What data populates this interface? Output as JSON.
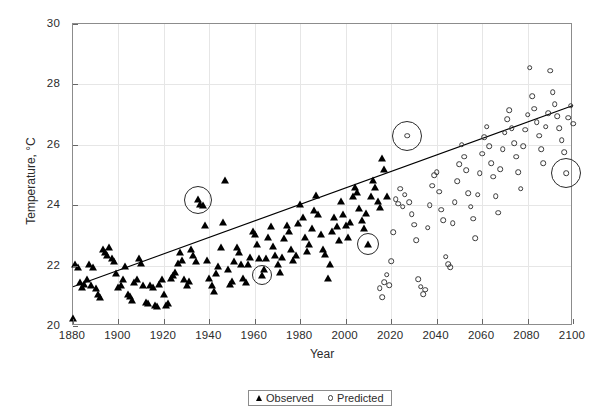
{
  "chart_data": {
    "type": "scatter",
    "title": "",
    "xlabel": "Year",
    "ylabel": "Temperature, °C",
    "xlim": [
      1880,
      2100
    ],
    "ylim": [
      20,
      30
    ],
    "xticks": [
      1880,
      1900,
      1920,
      1940,
      1960,
      1980,
      2000,
      2020,
      2040,
      2060,
      2080,
      2100
    ],
    "yticks": [
      20,
      22,
      24,
      26,
      28,
      30
    ],
    "grid": true,
    "legend_position": "below-plot-center",
    "legend": [
      {
        "label": "Observed",
        "marker": "filled-triangle",
        "color": "#000000"
      },
      {
        "label": "Predicted",
        "marker": "open-circle",
        "color": "#3a3a3a"
      }
    ],
    "trendline": {
      "type": "linear",
      "x": [
        1880,
        2100
      ],
      "y": [
        21.3,
        27.3
      ],
      "color": "#000000"
    },
    "series": [
      {
        "name": "Observed",
        "marker": "filled-triangle",
        "points": [
          [
            1880,
            20.25
          ],
          [
            1881,
            22.05
          ],
          [
            1882,
            21.95
          ],
          [
            1883,
            21.45
          ],
          [
            1884,
            21.3
          ],
          [
            1885,
            21.4
          ],
          [
            1886,
            21.55
          ],
          [
            1887,
            22.05
          ],
          [
            1888,
            21.35
          ],
          [
            1889,
            21.95
          ],
          [
            1890,
            21.25
          ],
          [
            1891,
            21.05
          ],
          [
            1892,
            20.95
          ],
          [
            1893,
            22.55
          ],
          [
            1894,
            22.45
          ],
          [
            1895,
            22.35
          ],
          [
            1896,
            22.6
          ],
          [
            1897,
            22.25
          ],
          [
            1898,
            22.15
          ],
          [
            1899,
            21.75
          ],
          [
            1900,
            21.3
          ],
          [
            1901,
            21.35
          ],
          [
            1902,
            21.55
          ],
          [
            1903,
            22.0
          ],
          [
            1904,
            21.05
          ],
          [
            1905,
            21.0
          ],
          [
            1906,
            20.85
          ],
          [
            1907,
            21.45
          ],
          [
            1908,
            21.55
          ],
          [
            1909,
            22.25
          ],
          [
            1910,
            22.1
          ],
          [
            1911,
            21.35
          ],
          [
            1912,
            20.8
          ],
          [
            1913,
            20.75
          ],
          [
            1914,
            21.35
          ],
          [
            1915,
            21.3
          ],
          [
            1916,
            20.7
          ],
          [
            1917,
            20.65
          ],
          [
            1918,
            21.4
          ],
          [
            1919,
            21.55
          ],
          [
            1920,
            21.05
          ],
          [
            1921,
            20.7
          ],
          [
            1922,
            20.75
          ],
          [
            1923,
            21.6
          ],
          [
            1924,
            21.7
          ],
          [
            1925,
            21.8
          ],
          [
            1926,
            22.1
          ],
          [
            1927,
            22.45
          ],
          [
            1928,
            22.2
          ],
          [
            1929,
            21.55
          ],
          [
            1930,
            21.35
          ],
          [
            1931,
            21.5
          ],
          [
            1932,
            22.55
          ],
          [
            1933,
            22.35
          ],
          [
            1934,
            22.15
          ],
          [
            1935,
            24.2
          ],
          [
            1936,
            24.05
          ],
          [
            1937,
            24.0
          ],
          [
            1938,
            23.35
          ],
          [
            1939,
            22.2
          ],
          [
            1940,
            21.6
          ],
          [
            1941,
            21.35
          ],
          [
            1942,
            21.15
          ],
          [
            1943,
            21.75
          ],
          [
            1944,
            22.0
          ],
          [
            1945,
            22.6
          ],
          [
            1946,
            23.45
          ],
          [
            1947,
            24.85
          ],
          [
            1948,
            21.9
          ],
          [
            1949,
            21.4
          ],
          [
            1950,
            21.5
          ],
          [
            1951,
            22.15
          ],
          [
            1952,
            22.6
          ],
          [
            1953,
            22.45
          ],
          [
            1954,
            22.05
          ],
          [
            1955,
            21.6
          ],
          [
            1956,
            21.45
          ],
          [
            1957,
            22.05
          ],
          [
            1958,
            22.3
          ],
          [
            1959,
            23.15
          ],
          [
            1960,
            23.05
          ],
          [
            1961,
            22.7
          ],
          [
            1962,
            22.25
          ],
          [
            1963,
            21.7
          ],
          [
            1964,
            21.9
          ],
          [
            1965,
            22.25
          ],
          [
            1966,
            22.95
          ],
          [
            1967,
            23.3
          ],
          [
            1968,
            22.65
          ],
          [
            1969,
            22.35
          ],
          [
            1970,
            22.05
          ],
          [
            1971,
            21.8
          ],
          [
            1972,
            22.3
          ],
          [
            1973,
            22.9
          ],
          [
            1974,
            23.35
          ],
          [
            1975,
            23.15
          ],
          [
            1976,
            22.55
          ],
          [
            1977,
            22.2
          ],
          [
            1978,
            22.35
          ],
          [
            1979,
            23.4
          ],
          [
            1980,
            24.05
          ],
          [
            1981,
            23.6
          ],
          [
            1982,
            22.95
          ],
          [
            1983,
            22.5
          ],
          [
            1984,
            22.7
          ],
          [
            1985,
            23.25
          ],
          [
            1986,
            23.85
          ],
          [
            1987,
            24.35
          ],
          [
            1988,
            23.7
          ],
          [
            1989,
            23.05
          ],
          [
            1990,
            22.55
          ],
          [
            1991,
            22.4
          ],
          [
            1992,
            21.6
          ],
          [
            1993,
            22.05
          ],
          [
            1994,
            23.15
          ],
          [
            1995,
            23.6
          ],
          [
            1996,
            23.3
          ],
          [
            1997,
            22.85
          ],
          [
            1998,
            24.15
          ],
          [
            1999,
            23.7
          ],
          [
            2000,
            23.35
          ],
          [
            2001,
            22.95
          ],
          [
            2002,
            23.45
          ],
          [
            2003,
            24.3
          ],
          [
            2004,
            24.6
          ],
          [
            2005,
            24.45
          ],
          [
            2006,
            23.9
          ],
          [
            2007,
            23.5
          ],
          [
            2008,
            23.25
          ],
          [
            2009,
            23.75
          ],
          [
            2010,
            22.7
          ],
          [
            2011,
            24.3
          ],
          [
            2012,
            24.85
          ],
          [
            2013,
            24.6
          ],
          [
            2014,
            24.15
          ],
          [
            2015,
            23.95
          ],
          [
            2016,
            25.55
          ],
          [
            2017,
            25.2
          ],
          [
            2018,
            24.3
          ]
        ]
      },
      {
        "name": "Predicted",
        "marker": "open-circle",
        "points": [
          [
            2015,
            21.25
          ],
          [
            2016,
            20.95
          ],
          [
            2017,
            21.45
          ],
          [
            2018,
            21.7
          ],
          [
            2019,
            21.35
          ],
          [
            2020,
            22.15
          ],
          [
            2021,
            23.1
          ],
          [
            2022,
            24.2
          ],
          [
            2023,
            24.05
          ],
          [
            2024,
            24.55
          ],
          [
            2025,
            23.95
          ],
          [
            2026,
            24.35
          ],
          [
            2027,
            26.3
          ],
          [
            2028,
            24.1
          ],
          [
            2029,
            23.7
          ],
          [
            2030,
            23.35
          ],
          [
            2031,
            22.85
          ],
          [
            2032,
            21.55
          ],
          [
            2033,
            21.3
          ],
          [
            2034,
            21.05
          ],
          [
            2035,
            21.2
          ],
          [
            2036,
            23.25
          ],
          [
            2037,
            24.0
          ],
          [
            2038,
            24.65
          ],
          [
            2039,
            25.0
          ],
          [
            2040,
            25.1
          ],
          [
            2041,
            24.45
          ],
          [
            2042,
            23.85
          ],
          [
            2043,
            23.5
          ],
          [
            2044,
            22.3
          ],
          [
            2045,
            22.05
          ],
          [
            2046,
            21.95
          ],
          [
            2047,
            23.4
          ],
          [
            2048,
            24.1
          ],
          [
            2049,
            24.8
          ],
          [
            2050,
            25.35
          ],
          [
            2051,
            26.0
          ],
          [
            2052,
            25.6
          ],
          [
            2053,
            25.15
          ],
          [
            2054,
            24.4
          ],
          [
            2055,
            23.95
          ],
          [
            2056,
            23.55
          ],
          [
            2057,
            22.9
          ],
          [
            2058,
            24.35
          ],
          [
            2059,
            25.05
          ],
          [
            2060,
            25.7
          ],
          [
            2061,
            26.25
          ],
          [
            2062,
            26.6
          ],
          [
            2063,
            25.95
          ],
          [
            2064,
            25.4
          ],
          [
            2065,
            24.95
          ],
          [
            2066,
            24.3
          ],
          [
            2067,
            23.75
          ],
          [
            2068,
            25.2
          ],
          [
            2069,
            25.85
          ],
          [
            2070,
            26.4
          ],
          [
            2071,
            26.85
          ],
          [
            2072,
            27.15
          ],
          [
            2073,
            26.55
          ],
          [
            2074,
            26.05
          ],
          [
            2075,
            25.6
          ],
          [
            2076,
            25.1
          ],
          [
            2077,
            24.55
          ],
          [
            2078,
            25.95
          ],
          [
            2079,
            26.5
          ],
          [
            2080,
            27.0
          ],
          [
            2081,
            28.55
          ],
          [
            2082,
            27.6
          ],
          [
            2083,
            27.2
          ],
          [
            2084,
            26.75
          ],
          [
            2085,
            26.3
          ],
          [
            2086,
            25.85
          ],
          [
            2087,
            25.4
          ],
          [
            2088,
            26.6
          ],
          [
            2089,
            27.05
          ],
          [
            2090,
            28.45
          ],
          [
            2091,
            27.75
          ],
          [
            2092,
            27.35
          ],
          [
            2093,
            26.95
          ],
          [
            2094,
            26.55
          ],
          [
            2095,
            26.15
          ],
          [
            2096,
            25.75
          ],
          [
            2097,
            25.05
          ],
          [
            2098,
            26.9
          ],
          [
            2099,
            27.3
          ],
          [
            2100,
            26.7
          ]
        ]
      }
    ],
    "highlighted": [
      {
        "x": 1935,
        "y": 24.18,
        "radius_px": 14,
        "series": "Observed"
      },
      {
        "x": 1963,
        "y": 21.7,
        "radius_px": 10,
        "series": "Observed"
      },
      {
        "x": 2010,
        "y": 22.7,
        "radius_px": 11,
        "series": "Observed"
      },
      {
        "x": 2027,
        "y": 26.3,
        "radius_px": 15,
        "series": "Predicted"
      },
      {
        "x": 2097,
        "y": 25.05,
        "radius_px": 15,
        "series": "Predicted"
      }
    ]
  }
}
